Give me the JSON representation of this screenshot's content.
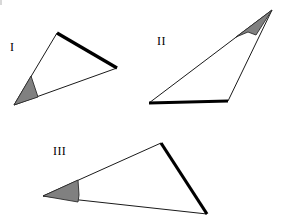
{
  "figure": {
    "background_color": "#ffffff",
    "width": 291,
    "height": 217,
    "stroke_color": "#1a1a1a",
    "thick_stroke_color": "#000000",
    "angle_fill_color": "#808080",
    "label_color": "#000000"
  },
  "labels": {
    "triangle_one": "I",
    "triangle_two": "II",
    "triangle_three": "III"
  },
  "shapes": [
    {
      "id": "triangle-one",
      "label": "I",
      "label_position": {
        "x": 10,
        "y": 41
      },
      "vertices": [
        {
          "name": "marked-vertex",
          "x": 14,
          "y": 105
        },
        {
          "name": "top-vertex",
          "x": 57,
          "y": 33
        },
        {
          "name": "right-vertex",
          "x": 117,
          "y": 68
        }
      ],
      "polygon_points": "14,105 57,33 117,68",
      "thin_edges": [
        {
          "from": [
            14,
            105
          ],
          "to": [
            57,
            33
          ]
        },
        {
          "from": [
            117,
            68
          ],
          "to": [
            14,
            105
          ]
        }
      ],
      "thick_edge": {
        "from": [
          57,
          33
        ],
        "to": [
          117,
          68
        ]
      },
      "marked_angle": {
        "vertex": [
          14,
          105
        ],
        "wedge_points": "14,105 31,76 38,97",
        "shaded": true
      }
    },
    {
      "id": "triangle-two",
      "label": "II",
      "label_position": {
        "x": 157,
        "y": 35
      },
      "vertices": [
        {
          "name": "left-vertex",
          "x": 149,
          "y": 103
        },
        {
          "name": "marked-vertex",
          "x": 272,
          "y": 10
        },
        {
          "name": "bottom-right-vertex",
          "x": 228,
          "y": 101
        }
      ],
      "polygon_points": "149,103 272,10 228,101",
      "thin_edges": [
        {
          "from": [
            149,
            103
          ],
          "to": [
            272,
            10
          ]
        },
        {
          "from": [
            272,
            10
          ],
          "to": [
            228,
            101
          ]
        }
      ],
      "thick_edge": {
        "from": [
          149,
          103
        ],
        "to": [
          228,
          101
        ]
      },
      "marked_angle": {
        "vertex": [
          272,
          10
        ],
        "wedge_points": "272,10 236,37 248,32 256,35",
        "shaded": true
      }
    },
    {
      "id": "triangle-three",
      "label": "III",
      "label_position": {
        "x": 53,
        "y": 145
      },
      "vertices": [
        {
          "name": "marked-vertex",
          "x": 43,
          "y": 196
        },
        {
          "name": "top-vertex",
          "x": 161,
          "y": 143
        },
        {
          "name": "bottom-right-vertex",
          "x": 207,
          "y": 214
        }
      ],
      "polygon_points": "43,196 161,143 207,214",
      "thin_edges": [
        {
          "from": [
            43,
            196
          ],
          "to": [
            161,
            143
          ]
        },
        {
          "from": [
            207,
            214
          ],
          "to": [
            43,
            196
          ]
        }
      ],
      "thick_edge": {
        "from": [
          161,
          143
        ],
        "to": [
          207,
          214
        ]
      },
      "marked_angle": {
        "vertex": [
          43,
          196
        ],
        "wedge_points": "43,196 78,180 79,195 78,202",
        "shaded": true
      }
    }
  ]
}
